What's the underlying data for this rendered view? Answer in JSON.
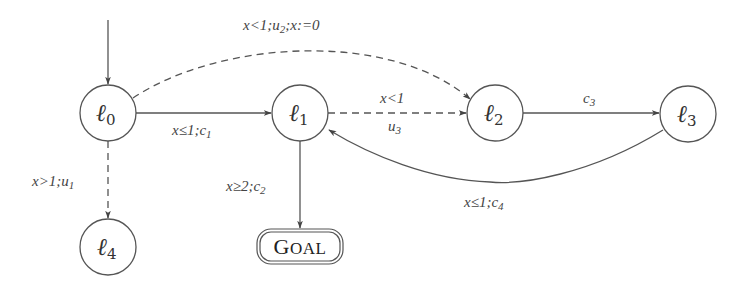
{
  "diagram": {
    "type": "timed-automaton",
    "nodes": [
      {
        "id": "l0",
        "name": "ℓ",
        "index": "0",
        "cx": 108,
        "cy": 113,
        "r": 28,
        "initial": true
      },
      {
        "id": "l1",
        "name": "ℓ",
        "index": "1",
        "cx": 300,
        "cy": 113,
        "r": 28
      },
      {
        "id": "l2",
        "name": "ℓ",
        "index": "2",
        "cx": 495,
        "cy": 113,
        "r": 28
      },
      {
        "id": "l3",
        "name": "ℓ",
        "index": "3",
        "cx": 688,
        "cy": 114,
        "r": 28
      },
      {
        "id": "l4",
        "name": "ℓ",
        "index": "4",
        "cx": 108,
        "cy": 247,
        "r": 28
      }
    ],
    "goal": {
      "id": "goal",
      "label_first": "G",
      "label_rest": "OAL",
      "full_label": "GOAL",
      "x": 257,
      "y": 229,
      "w": 86,
      "h": 35
    },
    "edges": [
      {
        "id": "e-l0-l1",
        "from": "l0",
        "to": "l1",
        "style": "solid",
        "kind": "controllable",
        "guard": "x≤1",
        "action": "c",
        "action_index": "1",
        "label": "x≤1;c1"
      },
      {
        "id": "e-l0-l2",
        "from": "l0",
        "to": "l2",
        "style": "dashed",
        "kind": "uncontrollable",
        "guard": "x<1",
        "action": "u",
        "action_index": "2",
        "reset": "x:=0",
        "label": "x<1;u2;x:=0"
      },
      {
        "id": "e-l0-l4",
        "from": "l0",
        "to": "l4",
        "style": "dashed",
        "kind": "uncontrollable",
        "guard": "x>1",
        "action": "u",
        "action_index": "1",
        "label": "x>1;u1"
      },
      {
        "id": "e-l1-l2",
        "from": "l1",
        "to": "l2",
        "style": "dashed",
        "kind": "uncontrollable",
        "guard": "x<1",
        "action": "u",
        "action_index": "3",
        "label_top": "x<1",
        "label_bottom": "u3"
      },
      {
        "id": "e-l1-goal",
        "from": "l1",
        "to": "goal",
        "style": "solid",
        "kind": "controllable",
        "guard": "x≥2",
        "action": "c",
        "action_index": "2",
        "label": "x≥2;c2"
      },
      {
        "id": "e-l2-l3",
        "from": "l2",
        "to": "l3",
        "style": "solid",
        "kind": "controllable",
        "action": "c",
        "action_index": "3",
        "label": "c3"
      },
      {
        "id": "e-l3-l1",
        "from": "l3",
        "to": "l1",
        "style": "solid",
        "kind": "controllable",
        "guard": "x≤1",
        "action": "c",
        "action_index": "4",
        "label": "x≤1;c4"
      }
    ],
    "colors": {
      "stroke": "#555555",
      "text": "#333333",
      "background": "#ffffff"
    }
  }
}
